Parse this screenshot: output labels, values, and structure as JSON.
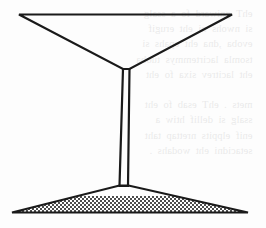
{
  "page": {
    "width": 266,
    "height": 228,
    "background_color": "#fdfdfd",
    "ink_color": "#1a1a1a",
    "stipple_color": "#6e6e6e"
  },
  "bleed_through": {
    "visible": true,
    "note": "faint mirrored text showing through from the reverse side of the paper, illegible",
    "text": "  ehT  gniward  fo  a  ssalg\n  si  nwohs  ni  eht  erugif\n  evoba  ,dna  eht  epahs  si\n  tsomla  lacirtemmys  tuoba\n  eht  lacitrev  sixa  fo  eht\n\n  mets  .  ehT  esab  fo  eht\n  ssalg  si  dellif  htiw  a\n  enif  elppits  nrettap  taht\n  setacidni  eht  wodahs  ."
  },
  "figure": {
    "name": "cocktail-glass-line-drawing",
    "stroke_width": 2.2,
    "parts": [
      {
        "name": "bowl",
        "shape": "inverted-triangle",
        "points": "19,14 232,14 130,69 123,69"
      },
      {
        "name": "stem",
        "shape": "tapered-vertical-bar",
        "points": "123,69 130,69 128,186 119,186"
      },
      {
        "name": "base",
        "shape": "wide-flat-triangle",
        "points": "119,186 128,186 248,213 12,213"
      },
      {
        "name": "base-stipple-fill",
        "shape": "halftone-checker",
        "fill": "50% checkerboard dither"
      }
    ]
  }
}
